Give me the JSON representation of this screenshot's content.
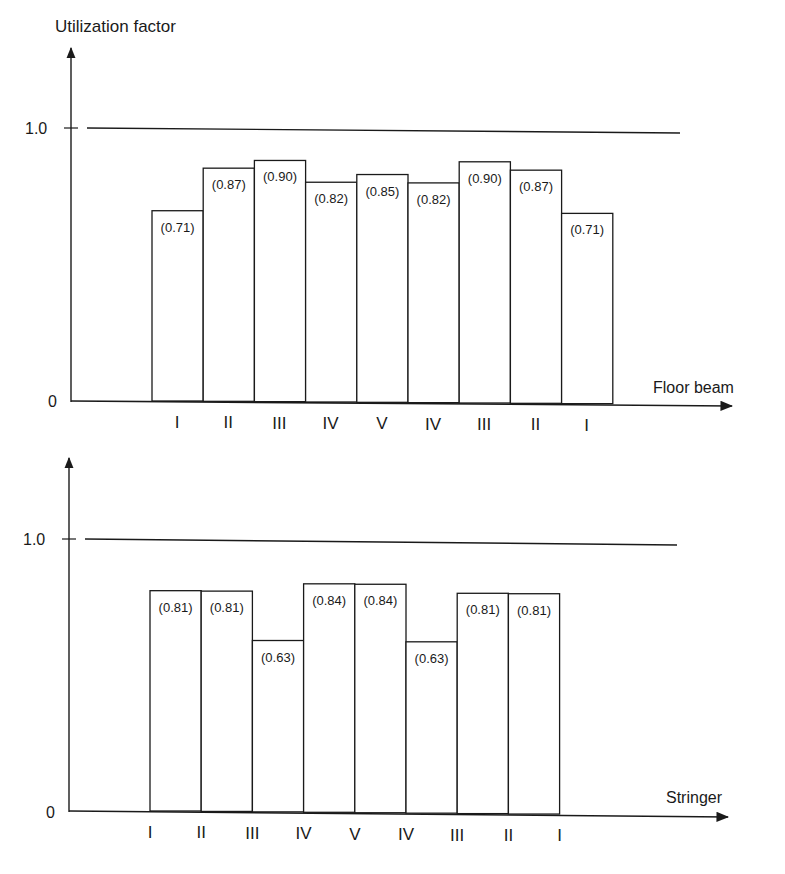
{
  "chart_data": [
    {
      "type": "bar",
      "title": "",
      "ylabel": "Utilization factor",
      "xlabel": "Floor beam",
      "categories": [
        "I",
        "II",
        "III",
        "IV",
        "V",
        "IV",
        "III",
        "II",
        "I"
      ],
      "values": [
        0.71,
        0.87,
        0.9,
        0.82,
        0.85,
        0.82,
        0.9,
        0.87,
        0.71
      ],
      "data_labels": [
        "(0.71)",
        "(0.87)",
        "(0.90)",
        "(0.82)",
        "(0.85)",
        "(0.82)",
        "(0.90)",
        "(0.87)",
        "(0.71)"
      ],
      "yticks": [
        "0",
        "1.0"
      ],
      "reference_line": 1.0,
      "ylim": [
        0,
        1.2
      ],
      "grid": false,
      "legend": null
    },
    {
      "type": "bar",
      "title": "",
      "ylabel": "",
      "xlabel": "Stringer",
      "categories": [
        "I",
        "II",
        "III",
        "IV",
        "V",
        "IV",
        "III",
        "II",
        "I"
      ],
      "values": [
        0.81,
        0.81,
        0.63,
        0.84,
        0.84,
        0.63,
        0.81,
        0.81
      ],
      "bar_categories": [
        "I-II",
        "II-III",
        "III-IV",
        "IV-V",
        "V-IV",
        "IV-III",
        "III-II",
        "II-I"
      ],
      "data_labels": [
        "(0.81)",
        "(0.81)",
        "(0.63)",
        "(0.84)",
        "(0.84)",
        "(0.63)",
        "(0.81)",
        "(0.81)"
      ],
      "yticks": [
        "0",
        "1.0"
      ],
      "reference_line": 1.0,
      "ylim": [
        0,
        1.2
      ],
      "grid": false,
      "legend": null
    }
  ],
  "top": {
    "ylabel": "Utilization factor",
    "xlabel": "Floor beam",
    "tick_zero": "0",
    "tick_one": "1.0"
  },
  "bottom": {
    "xlabel": "Stringer",
    "tick_zero": "0",
    "tick_one": "1.0"
  },
  "colors": {
    "ink": "#1a1a1a",
    "bar_fill": "#ffffff"
  }
}
